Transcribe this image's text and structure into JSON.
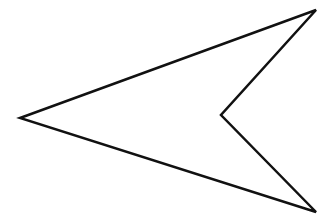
{
  "figure": {
    "shape": "concave-quadrilateral-arrowhead",
    "stroke_color": "#111111",
    "fill_color": "#ffffff",
    "stroke_width": 2.5,
    "vertices": [
      {
        "name": "left-tip",
        "x": 20,
        "y": 118
      },
      {
        "name": "top-right",
        "x": 316,
        "y": 10
      },
      {
        "name": "inner-notch",
        "x": 221,
        "y": 115
      },
      {
        "name": "bottom-right",
        "x": 316,
        "y": 212
      }
    ]
  }
}
